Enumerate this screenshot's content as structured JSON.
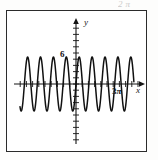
{
  "figure": {
    "kind": "cartesian-graph",
    "caption_bleed": "2π",
    "frame_color": "#2b2b2b",
    "curve_color": "#111111",
    "background": "#ffffff"
  },
  "axes": {
    "x_axis_label": "x",
    "y_axis_label": "y",
    "x_axis_name": "horizontal-axis",
    "y_axis_name": "vertical-axis",
    "origin_px": {
      "x": 76,
      "y": 84
    },
    "x_range_px": {
      "start": 14,
      "end": 142
    },
    "y_range_px": {
      "start": 20,
      "end": 144
    },
    "x_tick_spacing_px": 6.2,
    "y_tick_spacing_px": 6.2,
    "tick_half_length_px": 3
  },
  "tick_labels": {
    "y_marked_value": "6",
    "y_marked_value_px_y": 57,
    "x_marked_value": "3",
    "x_marked_symbol": "π",
    "x_marked_px_x": 116
  },
  "chart_data": {
    "type": "line",
    "title": "",
    "subtitle": "",
    "xlabel": "x",
    "ylabel": "y",
    "grid": false,
    "legend": null,
    "function": "y = 6 sin(kx)",
    "amplitude": 6,
    "visible_cycles": 10,
    "xlim": [
      -3.45,
      3.45
    ],
    "ylim": [
      -10.5,
      10.5
    ],
    "x_ticks": [
      3
    ],
    "x_tick_labels": [
      "3π"
    ],
    "y_ticks": [
      6
    ],
    "y_tick_labels": [
      "6"
    ],
    "annotations": [
      {
        "text": "6",
        "x": 0,
        "y": 6
      },
      {
        "text": "3π",
        "x": 3,
        "y": 0
      }
    ],
    "series": [
      {
        "name": "sinusoid",
        "color": "#111111",
        "amplitude_px": 27,
        "period_px": 12.9,
        "phase_px": 76,
        "x_start_px": 20,
        "x_end_px": 134,
        "baseline_px": 84
      }
    ]
  }
}
